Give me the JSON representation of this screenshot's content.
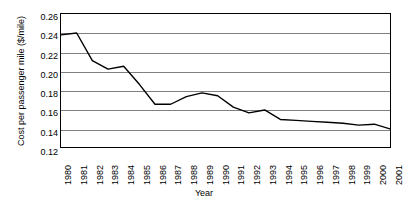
{
  "chart_data": {
    "type": "line",
    "title": "",
    "xlabel": "Year",
    "ylabel": "Cost per passenger mile ($/mile)",
    "xlim": [
      1980,
      2001
    ],
    "ylim": [
      0.12,
      0.26
    ],
    "ytick_step": 0.02,
    "grid": true,
    "legend": null,
    "legend_position": "none",
    "line_color": "#000000",
    "grid_color": "#808080",
    "axis_color": "#000000",
    "background": "#ffffff",
    "categories": [
      "1980",
      "1981",
      "1982",
      "1983",
      "1984",
      "1985",
      "1986",
      "1987",
      "1988",
      "1989",
      "1990",
      "1991",
      "1992",
      "1993",
      "1994",
      "1995",
      "1996",
      "1997",
      "1998",
      "1999",
      "2000",
      "2001"
    ],
    "x": [
      1980,
      1981,
      1982,
      1983,
      1984,
      1985,
      1986,
      1987,
      1988,
      1989,
      1990,
      1991,
      1992,
      1993,
      1994,
      1995,
      1996,
      1997,
      1998,
      1999,
      2000,
      2001
    ],
    "values": [
      0.238,
      0.24,
      0.211,
      0.202,
      0.205,
      0.186,
      0.165,
      0.165,
      0.173,
      0.177,
      0.174,
      0.162,
      0.156,
      0.159,
      0.149,
      0.148,
      0.147,
      0.146,
      0.145,
      0.143,
      0.144,
      0.139
    ],
    "ytick_labels": [
      "0.26",
      "0.24",
      "0.22",
      "0.20",
      "0.18",
      "0.16",
      "0.14",
      "0.12"
    ],
    "ytick_values": [
      0.26,
      0.24,
      0.22,
      0.2,
      0.18,
      0.16,
      0.14,
      0.12
    ]
  }
}
